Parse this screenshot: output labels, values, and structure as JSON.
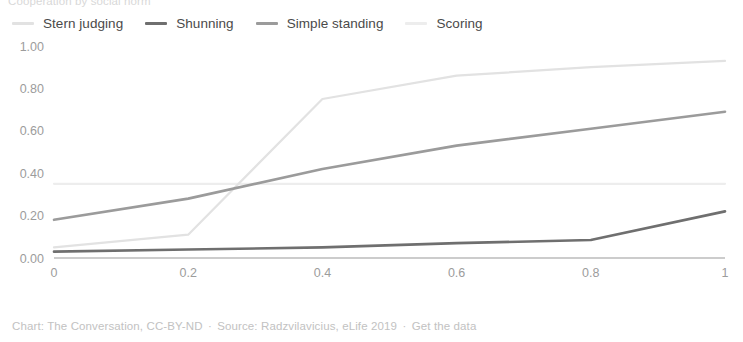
{
  "title": {
    "clipped_text": "Cooperation by social norm"
  },
  "legend": {
    "position": "top-left",
    "items": [
      {
        "label": "Stern judging",
        "color": "#e2e2e2"
      },
      {
        "label": "Shunning",
        "color": "#6f6f6f"
      },
      {
        "label": "Simple standing",
        "color": "#9b9b9b"
      },
      {
        "label": "Scoring",
        "color": "#ededed"
      }
    ]
  },
  "footer": {
    "chart_credit": "Chart: The Conversation, CC-BY-ND",
    "separator": "·",
    "source": "Source: Radzvilavicius, eLife 2019",
    "get_data_link": "Get the data"
  },
  "chart_data": {
    "type": "line",
    "title": "",
    "xlabel": "",
    "ylabel": "",
    "xlim": [
      0,
      1
    ],
    "ylim": [
      0,
      1
    ],
    "grid": false,
    "legend_position": "top-left",
    "x": [
      0,
      0.2,
      0.4,
      0.6,
      0.8,
      1
    ],
    "xtick_labels": [
      "0",
      "0.2",
      "0.4",
      "0.6",
      "0.8",
      "1"
    ],
    "ytick_values": [
      0.0,
      0.2,
      0.4,
      0.6,
      0.8,
      1.0
    ],
    "ytick_labels": [
      "0.00",
      "0.20",
      "0.40",
      "0.60",
      "0.80",
      "1.00"
    ],
    "series": [
      {
        "name": "Stern judging",
        "color": "#e2e2e2",
        "width": 2.2,
        "values": [
          0.05,
          0.11,
          0.75,
          0.86,
          0.9,
          0.93
        ]
      },
      {
        "name": "Shunning",
        "color": "#6f6f6f",
        "width": 2.6,
        "values": [
          0.03,
          0.04,
          0.05,
          0.07,
          0.085,
          0.22
        ]
      },
      {
        "name": "Simple standing",
        "color": "#9b9b9b",
        "width": 2.6,
        "values": [
          0.18,
          0.28,
          0.42,
          0.53,
          0.61,
          0.69
        ]
      },
      {
        "name": "Scoring",
        "color": "#ededed",
        "width": 2.2,
        "values": [
          0.35,
          0.35,
          0.35,
          0.35,
          0.35,
          0.35
        ]
      }
    ]
  }
}
